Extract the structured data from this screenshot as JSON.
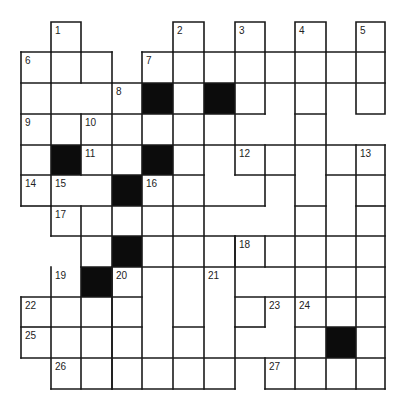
{
  "puzzle": {
    "type": "crossword",
    "columns_x": [
      21,
      51,
      81,
      112,
      142,
      173,
      204,
      235,
      265,
      295,
      326,
      356,
      385
    ],
    "rows_y": [
      22,
      52,
      83,
      114,
      145,
      175,
      206,
      236,
      267,
      297,
      327,
      358,
      389
    ],
    "black_cells": [
      [
        2,
        4
      ],
      [
        2,
        6
      ],
      [
        4,
        1
      ],
      [
        4,
        4
      ],
      [
        5,
        3
      ],
      [
        7,
        3
      ],
      [
        8,
        2
      ],
      [
        10,
        10
      ]
    ],
    "numbers": [
      {
        "n": "1",
        "r": 0,
        "c": 1
      },
      {
        "n": "2",
        "r": 0,
        "c": 5
      },
      {
        "n": "3",
        "r": 0,
        "c": 7
      },
      {
        "n": "4",
        "r": 0,
        "c": 9
      },
      {
        "n": "5",
        "r": 0,
        "c": 11
      },
      {
        "n": "6",
        "r": 1,
        "c": 0
      },
      {
        "n": "7",
        "r": 1,
        "c": 4
      },
      {
        "n": "8",
        "r": 2,
        "c": 3
      },
      {
        "n": "9",
        "r": 3,
        "c": 0
      },
      {
        "n": "10",
        "r": 3,
        "c": 2
      },
      {
        "n": "11",
        "r": 4,
        "c": 2
      },
      {
        "n": "12",
        "r": 4,
        "c": 7
      },
      {
        "n": "13",
        "r": 4,
        "c": 11
      },
      {
        "n": "14",
        "r": 5,
        "c": 0
      },
      {
        "n": "15",
        "r": 5,
        "c": 1
      },
      {
        "n": "16",
        "r": 5,
        "c": 4
      },
      {
        "n": "17",
        "r": 6,
        "c": 1
      },
      {
        "n": "18",
        "r": 7,
        "c": 7
      },
      {
        "n": "19",
        "r": 8,
        "c": 1
      },
      {
        "n": "20",
        "r": 8,
        "c": 3
      },
      {
        "n": "21",
        "r": 8,
        "c": 6
      },
      {
        "n": "22",
        "r": 9,
        "c": 0
      },
      {
        "n": "23",
        "r": 9,
        "c": 8
      },
      {
        "n": "24",
        "r": 9,
        "c": 9
      },
      {
        "n": "25",
        "r": 10,
        "c": 0
      },
      {
        "n": "26",
        "r": 11,
        "c": 1
      },
      {
        "n": "27",
        "r": 11,
        "c": 8
      }
    ]
  }
}
